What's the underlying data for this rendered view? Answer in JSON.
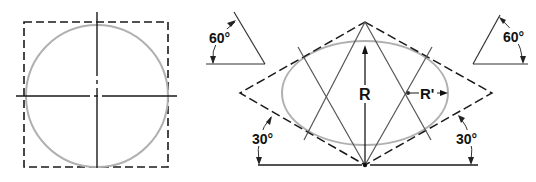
{
  "figure": {
    "left_view": {
      "description": "circle inscribed in square with center lines"
    },
    "right_view": {
      "description": "isometric ellipse constructed in rhombus (four-center method)",
      "labels": {
        "radius_major": "R",
        "radius_minor": "R'",
        "angle_left_bottom": "30°",
        "angle_right_bottom": "30°",
        "angle_left_triangle": "60°",
        "angle_right_triangle": "60°"
      }
    },
    "colors": {
      "line": "#1a1a1a",
      "construction": "#555555",
      "circle": "#b0b0b0"
    }
  }
}
